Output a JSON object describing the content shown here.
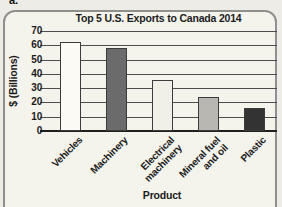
{
  "page_label": "a.",
  "colors": {
    "panel_background": "#f4f3ec",
    "panel_border": "#8f8f8d",
    "gridline": "#4e4e4e",
    "axis_line": "#1f1f1f",
    "text": "#1c1c1c"
  },
  "chart_data": {
    "type": "bar",
    "title": "Top 5 U.S. Exports to Canada 2014",
    "xlabel": "Product",
    "ylabel": "$ (Billions)",
    "ylim": [
      0,
      70
    ],
    "yticks": [
      0,
      10,
      20,
      30,
      40,
      50,
      60,
      70
    ],
    "grid": true,
    "legend": "none",
    "categories": [
      "Vehicles",
      "Machinery",
      "Electrical\nmachinery",
      "Mineral fuel\nand oil",
      "Plastic"
    ],
    "values": [
      62,
      58,
      36,
      24,
      16
    ],
    "bar_colors": [
      "#fbfaf4",
      "#6b6b6b",
      "#f1f0e8",
      "#b8b7b2",
      "#333333"
    ],
    "bar_border_color": "#3c3c3c"
  }
}
